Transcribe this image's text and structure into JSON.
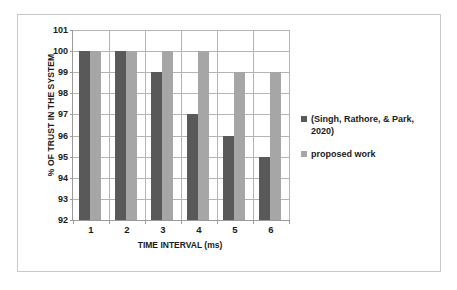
{
  "chart_data": {
    "type": "bar",
    "title": "",
    "xlabel": "TIME INTERVAL (ms)",
    "ylabel": "% OF TRUST IN THE SYSTEM",
    "categories": [
      "1",
      "2",
      "3",
      "4",
      "5",
      "6"
    ],
    "series": [
      {
        "name": "(Singh, Rathore, & Park, 2020)",
        "color": "#595959",
        "values": [
          100,
          100,
          99,
          97,
          96,
          95
        ]
      },
      {
        "name": "proposed work",
        "color": "#a6a6a6",
        "values": [
          100,
          100,
          100,
          100,
          99,
          99
        ]
      }
    ],
    "ylim": [
      92,
      101
    ],
    "ytick_labels": [
      "101",
      "100",
      "99",
      "98",
      "97",
      "96",
      "95",
      "94",
      "93",
      "92"
    ],
    "ytick_values": [
      101,
      100,
      99,
      98,
      97,
      96,
      95,
      94,
      93,
      92
    ],
    "grid": "both",
    "legend_position": "right"
  },
  "colors": {
    "series_a": "#595959",
    "series_b": "#a6a6a6",
    "gridline": "#b4b4b4",
    "axis": "#9a9a9a",
    "border": "#c8c8c8",
    "text": "#1a1a1a",
    "background": "#ffffff"
  }
}
